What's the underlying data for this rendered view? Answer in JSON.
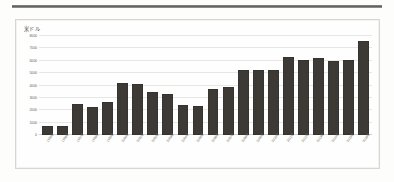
{
  "document": {
    "rule_label": "horizontal-rule"
  },
  "chart_data": {
    "type": "bar",
    "title": "",
    "subtitle": "",
    "xlabel": "",
    "ylabel": "米ドル",
    "unit_caption": "米ドル",
    "ylim": [
      0,
      8000
    ],
    "grid": true,
    "legend": null,
    "bar_color": "#3d3a36",
    "gridline_color": "#e9e7e3",
    "panel_border_color": "#d8d6d2",
    "yticks": [
      0,
      1000,
      2000,
      3000,
      4000,
      5000,
      6000,
      7000,
      8000
    ],
    "ytick_labels": [
      "0",
      "1000",
      "2000",
      "3000",
      "4000",
      "5000",
      "6000",
      "7000",
      "8000"
    ],
    "categories": [
      "1995年",
      "1996年",
      "1997年",
      "1998年",
      "1999年",
      "2000年",
      "2001年",
      "2002年",
      "2003年",
      "2004年",
      "2005年",
      "2006年",
      "2007年",
      "2008年",
      "2009年",
      "2010年",
      "2011年",
      "2012年",
      "2013年",
      "2014年",
      "2015年",
      "2016年"
    ],
    "values": [
      700,
      760,
      2500,
      2300,
      2700,
      4200,
      4150,
      3500,
      3350,
      2450,
      2350,
      3750,
      3900,
      5250,
      5250,
      5250,
      6300,
      6050,
      6200,
      5950,
      6100,
      7600
    ]
  }
}
